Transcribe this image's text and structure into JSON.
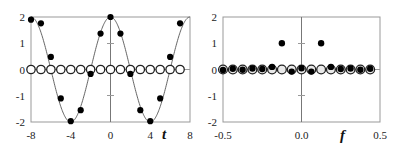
{
  "chart_data": [
    {
      "type": "scatter",
      "title": "",
      "xlabel": "t",
      "ylabel": "",
      "xlim": [
        -8,
        8
      ],
      "ylim": [
        -2,
        2
      ],
      "xticks": [
        "-8",
        "-4",
        "0",
        "4",
        "8"
      ],
      "yticks": [
        "2",
        "1",
        "0",
        "-1",
        "-2"
      ],
      "grid": false,
      "series": [
        {
          "name": "samples (filled)",
          "marker": "filled-circle",
          "x": [
            -8,
            -7,
            -6,
            -5,
            -4,
            -3,
            -2,
            -1,
            0,
            1,
            2,
            3,
            4,
            5,
            6,
            7
          ],
          "values": [
            1.9,
            1.76,
            0.48,
            -1.1,
            -1.97,
            -1.55,
            -0.17,
            1.37,
            2.0,
            1.37,
            -0.17,
            -1.55,
            -1.97,
            -1.1,
            0.48,
            1.76
          ]
        },
        {
          "name": "imaginary (open)",
          "marker": "open-circle",
          "x": [
            -8,
            -7,
            -6,
            -5,
            -4,
            -3,
            -2,
            -1,
            0,
            1,
            2,
            3,
            4,
            5,
            6,
            7
          ],
          "values": [
            0,
            0,
            0,
            0,
            0,
            0,
            0,
            0,
            0,
            0,
            0,
            0,
            0,
            0,
            0,
            0
          ]
        },
        {
          "name": "continuous cosine",
          "type": "line",
          "function": "2*cos(2*pi*t/8)",
          "period": 8,
          "amplitude": 2
        }
      ]
    },
    {
      "type": "scatter",
      "title": "",
      "xlabel": "f",
      "ylabel": "",
      "xlim": [
        -0.5,
        0.5
      ],
      "ylim": [
        -2,
        2
      ],
      "xticks": [
        "-0.5",
        "0.0",
        "0.5"
      ],
      "yticks": [
        "2",
        "1",
        "0",
        "-1",
        "-2"
      ],
      "grid": false,
      "series": [
        {
          "name": "spectrum real (filled)",
          "marker": "filled-circle",
          "x": [
            -0.5,
            -0.4375,
            -0.375,
            -0.3125,
            -0.25,
            -0.1875,
            -0.125,
            -0.0625,
            0,
            0.0625,
            0.125,
            0.1875,
            0.25,
            0.3125,
            0.375,
            0.4375
          ],
          "values": [
            -0.02,
            0.03,
            -0.01,
            0.04,
            0.02,
            0.1,
            1.0,
            -0.08,
            0.05,
            -0.08,
            1.0,
            0.1,
            0.02,
            0.04,
            -0.01,
            0.03
          ]
        },
        {
          "name": "spectrum imaginary (open)",
          "marker": "open-circle",
          "x": [
            -0.5,
            -0.4375,
            -0.375,
            -0.3125,
            -0.25,
            -0.1875,
            -0.125,
            -0.0625,
            0,
            0.0625,
            0.125,
            0.1875,
            0.25,
            0.3125,
            0.375,
            0.4375
          ],
          "values": [
            0,
            0,
            0,
            0,
            0,
            0,
            0,
            0,
            0,
            0,
            0,
            0,
            0,
            0,
            0,
            0
          ]
        }
      ]
    }
  ]
}
